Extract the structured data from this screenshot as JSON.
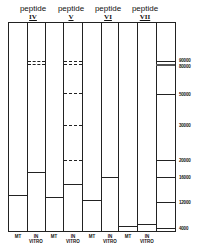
{
  "figure": {
    "groups": [
      {
        "label": "peptide",
        "roman": "IV",
        "x": 33
      },
      {
        "label": "peptide",
        "roman": "V",
        "x": 71
      },
      {
        "label": "peptide",
        "roman": "VI",
        "x": 108
      },
      {
        "label": "peptide",
        "roman": "VII",
        "x": 145
      }
    ],
    "lane_labels": [
      {
        "line1": "MT",
        "line2": "",
        "x": 8
      },
      {
        "line1": "IN",
        "line2": "VITRO",
        "x": 26
      },
      {
        "line1": "MT",
        "line2": "",
        "x": 44
      },
      {
        "line1": "IN",
        "line2": "VITRO",
        "x": 63
      },
      {
        "line1": "MT",
        "line2": "",
        "x": 82
      },
      {
        "line1": "IN",
        "line2": "VITRO",
        "x": 100
      },
      {
        "line1": "MT",
        "line2": "",
        "x": 118
      },
      {
        "line1": "IN",
        "line2": "VITRO",
        "x": 137
      }
    ],
    "markers": [
      {
        "label": "90000",
        "y": 61
      },
      {
        "label": "80000",
        "y": 66
      },
      {
        "label": "50000",
        "y": 94
      },
      {
        "label": "30000",
        "y": 125
      },
      {
        "label": "20000",
        "y": 160
      },
      {
        "label": "16000",
        "y": 177
      },
      {
        "label": "12000",
        "y": 202
      },
      {
        "label": "4000",
        "y": 228
      }
    ]
  }
}
